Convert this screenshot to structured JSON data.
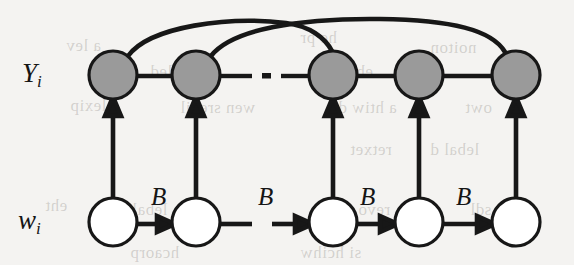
{
  "figure": {
    "type": "graphical-model-diagram",
    "caption_labels": {
      "top_row_label": "Y",
      "top_row_subscript": "i",
      "bottom_row_label": "w",
      "bottom_row_subscript": "i"
    },
    "colors": {
      "page_background": "#f4f3f1",
      "observed_node_fill": "#9a9a9a",
      "hidden_node_fill": "#ffffff",
      "stroke": "#171717",
      "bleed_text": "rgba(140,136,130,0.33)"
    },
    "top_row": {
      "name": "Y_i",
      "node_count": 5,
      "fill": "#9a9a9a",
      "nodes": [
        {
          "id": "y1",
          "cx": 113,
          "cy": 75,
          "r": 24
        },
        {
          "id": "y2",
          "cx": 196,
          "cy": 75,
          "r": 24
        },
        {
          "id": "y3",
          "cx": 333,
          "cy": 75,
          "r": 24
        },
        {
          "id": "y4",
          "cx": 419,
          "cy": 75,
          "r": 24
        },
        {
          "id": "y5",
          "cx": 516,
          "cy": 75,
          "r": 24
        }
      ],
      "ellipsis_x": 266,
      "ellipsis_y": 76
    },
    "bottom_row": {
      "name": "w_i",
      "node_count": 5,
      "fill": "#ffffff",
      "nodes": [
        {
          "id": "w1",
          "cx": 113,
          "cy": 222,
          "r": 24
        },
        {
          "id": "w2",
          "cx": 196,
          "cy": 222,
          "r": 24
        },
        {
          "id": "w3",
          "cx": 333,
          "cy": 222,
          "r": 24
        },
        {
          "id": "w4",
          "cx": 419,
          "cy": 222,
          "r": 24
        },
        {
          "id": "w5",
          "cx": 516,
          "cy": 222,
          "r": 24
        }
      ]
    },
    "transition_label": "B",
    "transition_labels": [
      {
        "text": "B",
        "x": 151,
        "y": 183
      },
      {
        "text": "B",
        "x": 258,
        "y": 183
      },
      {
        "text": "B",
        "x": 360,
        "y": 183
      },
      {
        "text": "B",
        "x": 456,
        "y": 183
      }
    ],
    "emission_arrows": [
      {
        "from": "w1",
        "to": "y1"
      },
      {
        "from": "w2",
        "to": "y2"
      },
      {
        "from": "w3",
        "to": "y3"
      },
      {
        "from": "w4",
        "to": "y4"
      },
      {
        "from": "w5",
        "to": "y5"
      }
    ],
    "long_range_arcs": [
      {
        "from": "y1",
        "to": "y3"
      },
      {
        "from": "y2",
        "to": "y5"
      }
    ]
  },
  "bleed_through_text": [
    {
      "text": "he pr",
      "x": 300,
      "y": 28
    },
    {
      "text": "a lev",
      "x": 66,
      "y": 36
    },
    {
      "text": "noiton",
      "x": 430,
      "y": 38
    },
    {
      "text": "detailed",
      "x": 150,
      "y": 62
    },
    {
      "text": "eht bna",
      "x": 320,
      "y": 62
    },
    {
      "text": "lexip",
      "x": 70,
      "y": 96
    },
    {
      "text": "wen srevil",
      "x": 180,
      "y": 98
    },
    {
      "text": "a htiw de",
      "x": 330,
      "y": 98
    },
    {
      "text": "owt",
      "x": 465,
      "y": 98
    },
    {
      "text": "retxet",
      "x": 350,
      "y": 140
    },
    {
      "text": "lebal d",
      "x": 430,
      "y": 140
    },
    {
      "text": "eht",
      "x": 45,
      "y": 196
    },
    {
      "text": "lebal s",
      "x": 120,
      "y": 200
    },
    {
      "text": "revo gni",
      "x": 330,
      "y": 200
    },
    {
      "text": "sdl",
      "x": 470,
      "y": 200
    },
    {
      "text": "hcaorp",
      "x": 130,
      "y": 243
    },
    {
      "text": "si hcihw",
      "x": 300,
      "y": 243
    }
  ]
}
